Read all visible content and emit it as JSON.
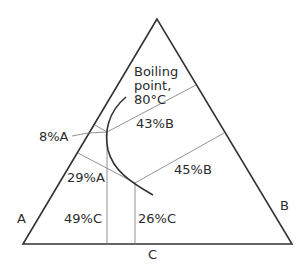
{
  "diagram": {
    "type": "ternary phase diagram",
    "vertices": {
      "left": "A",
      "right": "B",
      "bottom": "C"
    },
    "boiling_point_label": [
      "Boiling",
      "point,",
      "80°C"
    ],
    "labels": {
      "upper_A": "8%A",
      "upper_B": "43%B",
      "upper_C": "49%C",
      "lower_A": "29%A",
      "lower_B": "45%B",
      "lower_C": "26%C"
    },
    "colors": {
      "line": "#333333",
      "thin_line": "#666666",
      "background": "#ffffff"
    }
  }
}
